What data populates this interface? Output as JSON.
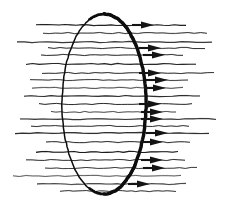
{
  "figure": {
    "canvas": {
      "width": 234,
      "height": 208,
      "background": "#ffffff"
    },
    "style": {
      "ink_color": "#141414",
      "line_color": "#1a1a1a",
      "loop_color": "#0d0d0d"
    }
  },
  "chart_data": {
    "type": "diagram",
    "xlabel": "",
    "ylabel": "",
    "legend": [],
    "annotations": [],
    "loop": {
      "name": "ellipse-outline",
      "shape": "ellipse",
      "center_x": 104,
      "center_y": 104,
      "radius_x": 42,
      "radius_y": 90,
      "stroke_left": 1.5,
      "stroke_right": 3.4
    },
    "flow_direction": "left-to-right",
    "line_count": 22,
    "arrow_count": 15,
    "lines": [
      {
        "y": 25,
        "x1": 36,
        "x2": 186,
        "width": 1.1,
        "arrow": true,
        "arrow_x": 141
      },
      {
        "y": 33,
        "x1": 43,
        "x2": 207,
        "width": 1.0,
        "arrow": false,
        "arrow_x": 0
      },
      {
        "y": 42,
        "x1": 17,
        "x2": 212,
        "width": 1.2,
        "arrow": false,
        "arrow_x": 0
      },
      {
        "y": 48,
        "x1": 48,
        "x2": 205,
        "width": 0.9,
        "arrow": true,
        "arrow_x": 148
      },
      {
        "y": 55,
        "x1": 41,
        "x2": 183,
        "width": 0.9,
        "arrow": true,
        "arrow_x": 152
      },
      {
        "y": 64,
        "x1": 26,
        "x2": 196,
        "width": 1.1,
        "arrow": false,
        "arrow_x": 0
      },
      {
        "y": 73,
        "x1": 42,
        "x2": 214,
        "width": 1.0,
        "arrow": true,
        "arrow_x": 148
      },
      {
        "y": 80,
        "x1": 30,
        "x2": 188,
        "width": 1.0,
        "arrow": true,
        "arrow_x": 155
      },
      {
        "y": 88,
        "x1": 32,
        "x2": 183,
        "width": 0.9,
        "arrow": true,
        "arrow_x": 153
      },
      {
        "y": 96,
        "x1": 24,
        "x2": 200,
        "width": 1.1,
        "arrow": false,
        "arrow_x": 0
      },
      {
        "y": 104,
        "x1": 39,
        "x2": 192,
        "width": 1.0,
        "arrow": true,
        "arrow_x": 148
      },
      {
        "y": 112,
        "x1": 51,
        "x2": 176,
        "width": 0.9,
        "arrow": true,
        "arrow_x": 150
      },
      {
        "y": 119,
        "x1": 20,
        "x2": 216,
        "width": 1.1,
        "arrow": true,
        "arrow_x": 150
      },
      {
        "y": 126,
        "x1": 31,
        "x2": 189,
        "width": 0.9,
        "arrow": false,
        "arrow_x": 0
      },
      {
        "y": 133,
        "x1": 15,
        "x2": 209,
        "width": 1.2,
        "arrow": true,
        "arrow_x": 155
      },
      {
        "y": 142,
        "x1": 46,
        "x2": 190,
        "width": 1.0,
        "arrow": true,
        "arrow_x": 150
      },
      {
        "y": 152,
        "x1": 36,
        "x2": 178,
        "width": 1.1,
        "arrow": false,
        "arrow_x": 0
      },
      {
        "y": 160,
        "x1": 26,
        "x2": 185,
        "width": 1.0,
        "arrow": true,
        "arrow_x": 150
      },
      {
        "y": 168,
        "x1": 45,
        "x2": 197,
        "width": 1.0,
        "arrow": true,
        "arrow_x": 152
      },
      {
        "y": 176,
        "x1": 13,
        "x2": 181,
        "width": 0.9,
        "arrow": false,
        "arrow_x": 0
      },
      {
        "y": 184,
        "x1": 37,
        "x2": 186,
        "width": 1.1,
        "arrow": true,
        "arrow_x": 137
      },
      {
        "y": 191,
        "x1": 60,
        "x2": 176,
        "width": 0.9,
        "arrow": false,
        "arrow_x": 0
      }
    ]
  }
}
